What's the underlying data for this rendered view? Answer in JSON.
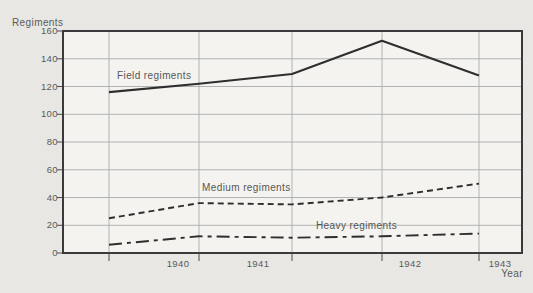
{
  "chart_data": {
    "type": "line",
    "title": "",
    "ylabel": "Regiments",
    "xlabel": "Year",
    "ylim": [
      0,
      160
    ],
    "y_ticks_top_to_bottom": [
      "160",
      "140",
      "120",
      "100",
      "80",
      "60",
      "40",
      "20",
      "0"
    ],
    "x_tick_labels": [
      "1940",
      "1941",
      "1942",
      "1943"
    ],
    "grid": "both",
    "legend": "inline-labels-next-to-lines",
    "x_positions_px": [
      109,
      199,
      292,
      382,
      479
    ],
    "series": [
      {
        "name": "Field regiments",
        "line_style": "solid",
        "values": [
          116,
          122,
          129,
          153,
          128
        ]
      },
      {
        "name": "Medium regiments",
        "line_style": "dashed",
        "values": [
          25,
          36,
          35,
          40,
          50
        ]
      },
      {
        "name": "Heavy regiments",
        "line_style": "dashdot",
        "values": [
          6,
          12,
          11,
          12,
          14
        ]
      }
    ],
    "colors": {
      "line": "#2e2e2e",
      "grid": "#a8acac",
      "text": "#5a5a5a",
      "paper": "#e8e7e3",
      "plot_background": "#f4f3f0"
    }
  }
}
